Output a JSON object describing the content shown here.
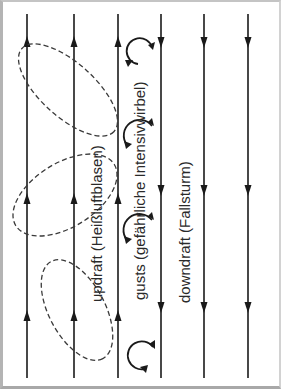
{
  "figure": {
    "labels": {
      "updraft": "updraft (Heißluftblasen)",
      "gusts": "gusts (gefährliche Intensivwirbel)",
      "downdraft": "downdraft (Fallsturm)"
    },
    "updraft_lines": [
      {
        "x": 27,
        "arrows_y": [
          46,
          205,
          336
        ],
        "direction": "up"
      },
      {
        "x": 74,
        "arrows_y": [
          46,
          205,
          336
        ],
        "direction": "up"
      },
      {
        "x": 118,
        "arrows_y": [
          46,
          205,
          336
        ],
        "direction": "up"
      }
    ],
    "downdraft_lines": [
      {
        "x": 161,
        "arrows_y": [
          40,
          185,
          305
        ],
        "direction": "down"
      },
      {
        "x": 204,
        "arrows_y": [
          40,
          185,
          305
        ],
        "direction": "down"
      },
      {
        "x": 248,
        "arrows_y": [
          40,
          185,
          305
        ],
        "direction": "down"
      }
    ],
    "dashed_bubbles": [
      {
        "name": "upper-bubble",
        "cx": 68,
        "cy": 92
      },
      {
        "name": "middle-bubble",
        "cx": 65,
        "cy": 196
      },
      {
        "name": "lower-bubble",
        "cx": 77,
        "cy": 310
      }
    ],
    "gust_vortices": [
      {
        "cx": 135,
        "cy": 45
      },
      {
        "cx": 135,
        "cy": 132
      },
      {
        "cx": 135,
        "cy": 228
      },
      {
        "cx": 138,
        "cy": 355
      }
    ],
    "colors": {
      "line": "#1a1a1a",
      "dashed": "#3a3a3a",
      "text": "#2a2a2a",
      "background": "#ffffff",
      "frame": "#b4b4b4"
    }
  }
}
